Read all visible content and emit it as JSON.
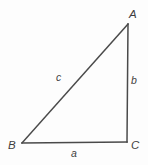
{
  "figure": {
    "type": "right-triangle-diagram",
    "background_color": "#fdfdfd",
    "stroke_color": "#4a4a4a",
    "text_color": "#3f3f3f",
    "stroke_width": 1.4,
    "canvas": {
      "width": 148,
      "height": 165
    },
    "vertices": [
      {
        "name": "A",
        "label": "A",
        "x": 128,
        "y": 24,
        "label_x": 133,
        "label_y": 14
      },
      {
        "name": "B",
        "label": "B",
        "x": 22,
        "y": 143,
        "label_x": 12,
        "label_y": 146
      },
      {
        "name": "C",
        "label": "C",
        "x": 127,
        "y": 142,
        "label_x": 134,
        "label_y": 146
      }
    ],
    "sides": [
      {
        "name": "a",
        "label": "a",
        "between": "B-C",
        "label_x": 74,
        "label_y": 153
      },
      {
        "name": "b",
        "label": "b",
        "between": "A-C",
        "label_x": 134,
        "label_y": 80
      },
      {
        "name": "c",
        "label": "c",
        "between": "A-B",
        "label_x": 60,
        "label_y": 77
      }
    ]
  }
}
